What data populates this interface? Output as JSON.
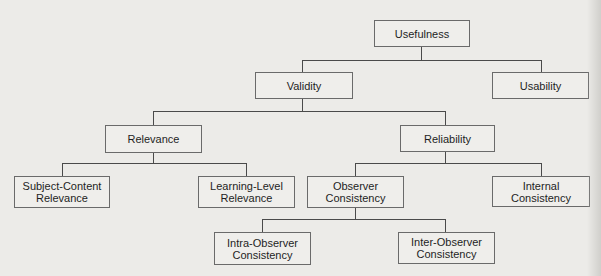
{
  "diagram": {
    "type": "hierarchy-tree",
    "nodes": {
      "usefulness": "Usefulness",
      "validity": "Validity",
      "usability": "Usability",
      "relevance": "Relevance",
      "reliability": "Reliability",
      "subject_content_relevance": "Subject-Content Relevance",
      "learning_level_relevance": "Learning-Level Relevance",
      "observer_consistency": "Observer Consistency",
      "internal_consistency": "Internal Consistency",
      "intra_observer_consistency": "Intra-Observer Consistency",
      "inter_observer_consistency": "Inter-Observer Consistency"
    },
    "edges": [
      [
        "Usefulness",
        "Validity"
      ],
      [
        "Usefulness",
        "Usability"
      ],
      [
        "Validity",
        "Relevance"
      ],
      [
        "Validity",
        "Reliability"
      ],
      [
        "Relevance",
        "Subject-Content Relevance"
      ],
      [
        "Relevance",
        "Learning-Level Relevance"
      ],
      [
        "Reliability",
        "Observer Consistency"
      ],
      [
        "Reliability",
        "Internal Consistency"
      ],
      [
        "Observer Consistency",
        "Intra-Observer Consistency"
      ],
      [
        "Observer Consistency",
        "Inter-Observer Consistency"
      ]
    ]
  },
  "colors": {
    "background": "#ecebe8",
    "box_border": "#6a6a6a",
    "connector": "#4a4a4a",
    "text": "#1e1e1e"
  }
}
